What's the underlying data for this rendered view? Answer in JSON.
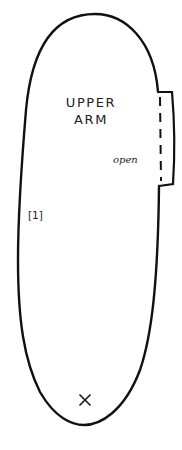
{
  "pattern_piece": {
    "title_line1": "UPPER",
    "title_line2": "ARM",
    "opening_label": "open",
    "piece_number": "[1]",
    "marker_symbol": "×",
    "outline_color": "#111111",
    "text_color": "#222222"
  }
}
